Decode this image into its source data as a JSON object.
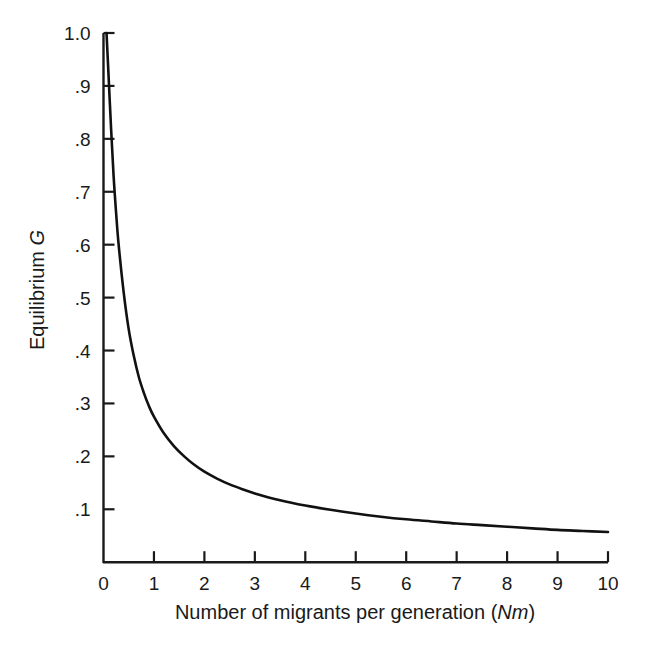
{
  "chart_data": {
    "type": "line",
    "title": "",
    "xlabel": "Number of migrants per generation (Nm)",
    "xlabel_plain": "Number of migrants per generation (",
    "xlabel_italic": "Nm",
    "xlabel_close": ")",
    "ylabel": "Equilibrium G",
    "ylabel_plain": "Equilibrium ",
    "ylabel_italic": "G",
    "xlim": [
      0,
      10
    ],
    "ylim": [
      0,
      1.0
    ],
    "grid": false,
    "legend": null,
    "line_color": "#111111",
    "axis_color": "#1a1a1a",
    "background_color": "#ffffff",
    "xticks": [
      0,
      1,
      2,
      3,
      4,
      5,
      6,
      7,
      8,
      9,
      10
    ],
    "xticklabels": [
      "0",
      "1",
      "2",
      "3",
      "4",
      "5",
      "6",
      "7",
      "8",
      "9",
      "10"
    ],
    "yticks": [
      0.1,
      0.2,
      0.3,
      0.4,
      0.5,
      0.6,
      0.7,
      0.8,
      0.9,
      1.0
    ],
    "yticklabels": [
      ".1",
      ".2",
      ".3",
      ".4",
      ".5",
      ".6",
      ".7",
      ".8",
      ".9",
      "1.0"
    ],
    "series": [
      {
        "name": "Equilibrium G vs Nm",
        "x": [
          0.06,
          0.1,
          0.15,
          0.2,
          0.25,
          0.3,
          0.4,
          0.5,
          0.6,
          0.7,
          0.8,
          0.9,
          1.0,
          1.2,
          1.4,
          1.6,
          1.8,
          2.0,
          2.25,
          2.5,
          2.75,
          3.0,
          3.5,
          4.0,
          4.5,
          5.0,
          5.5,
          6.0,
          6.5,
          7.0,
          7.5,
          8.0,
          8.5,
          9.0,
          9.5,
          10.0
        ],
        "y": [
          1.0,
          0.92,
          0.82,
          0.73,
          0.66,
          0.6,
          0.51,
          0.44,
          0.39,
          0.35,
          0.32,
          0.295,
          0.275,
          0.243,
          0.219,
          0.2,
          0.184,
          0.171,
          0.158,
          0.147,
          0.138,
          0.13,
          0.117,
          0.107,
          0.099,
          0.092,
          0.086,
          0.081,
          0.077,
          0.073,
          0.07,
          0.067,
          0.064,
          0.061,
          0.059,
          0.057
        ]
      }
    ],
    "notable_points": [
      {
        "x": 0.1,
        "y": 1.0,
        "note": "curve origin at top of y-axis"
      },
      {
        "x": 1,
        "y": 0.275,
        "note": "value at one migrant per generation"
      },
      {
        "x": 2,
        "y": 0.171,
        "note": "value at two migrants per generation"
      },
      {
        "x": 3,
        "y": 0.13,
        "note": "value at three migrants per generation"
      },
      {
        "x": 5,
        "y": 0.092,
        "note": "curve nearly flat"
      },
      {
        "x": 10,
        "y": 0.057,
        "note": "right end of curve"
      }
    ]
  }
}
